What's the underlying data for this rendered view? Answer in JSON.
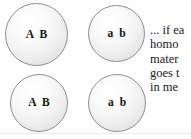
{
  "figure": {
    "background_color": "#fefefe",
    "cells": [
      {
        "id": "cell-1",
        "label": "A B",
        "row": 1,
        "column": 1
      },
      {
        "id": "cell-2",
        "label": "a b",
        "row": 1,
        "column": 2
      },
      {
        "id": "cell-3",
        "label": "A B",
        "row": 2,
        "column": 1
      },
      {
        "id": "cell-4",
        "label": "a b",
        "row": 2,
        "column": 2
      }
    ],
    "cell_outline_color": "#8e8e8e",
    "cell_fill_color": "#f0f0f0",
    "label_color": "#111111"
  },
  "caption": {
    "lines": [
      "... if ea",
      "homo",
      "mater",
      "goes t",
      "in me"
    ],
    "text_color": "#1a1a1a"
  },
  "rule": {
    "color": "#ececec"
  }
}
